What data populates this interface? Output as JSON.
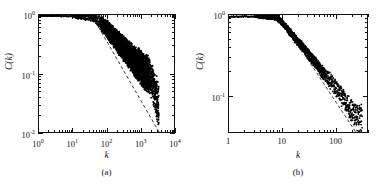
{
  "figure": {
    "panels": [
      {
        "caption": "(a)",
        "xlabel": "k",
        "ylabel": "C(k)",
        "xticklabels": [
          "10",
          "10",
          "10",
          "10",
          "10"
        ],
        "xtickexponents": [
          "0",
          "1",
          "2",
          "3",
          "4"
        ],
        "yticklabels": [
          "10",
          "10",
          "10"
        ],
        "ytickexponents": [
          "0",
          "-1",
          "-2"
        ]
      },
      {
        "caption": "(b)",
        "xlabel": "k",
        "ylabel": "C(k)",
        "xticklabels": [
          "1",
          "10",
          "100"
        ],
        "xtickexponents": [
          "",
          "",
          ""
        ],
        "yticklabels": [
          "10",
          "10"
        ],
        "ytickexponents": [
          "0",
          "-1"
        ]
      }
    ]
  },
  "chart_data": [
    {
      "type": "scatter",
      "title": "",
      "subtitle": "(a)",
      "xlabel": "k",
      "ylabel": "C(k)",
      "xscale": "log",
      "yscale": "log",
      "xlim": [
        1,
        10000
      ],
      "ylim": [
        0.01,
        1
      ],
      "grid": false,
      "legend": null,
      "series": [
        {
          "name": "clustering coefficient data",
          "marker": "filled-circle",
          "color": "#000000",
          "description": "Flat plateau near C(k)=1 for k below ~40, then a power-law decay with a broad dense cloud of points between k=300 and k=3000 spanning C(k) from about 0.3 down to 0.025",
          "points": [
            {
              "x": 1,
              "y": 0.97
            },
            {
              "x": 2,
              "y": 0.96
            },
            {
              "x": 3,
              "y": 0.97
            },
            {
              "x": 4,
              "y": 0.95
            },
            {
              "x": 6,
              "y": 0.96
            },
            {
              "x": 8,
              "y": 0.95
            },
            {
              "x": 10,
              "y": 0.95
            },
            {
              "x": 14,
              "y": 0.94
            },
            {
              "x": 20,
              "y": 0.93
            },
            {
              "x": 30,
              "y": 0.92
            },
            {
              "x": 40,
              "y": 0.9
            },
            {
              "x": 55,
              "y": 0.82
            },
            {
              "x": 70,
              "y": 0.72
            },
            {
              "x": 90,
              "y": 0.62
            },
            {
              "x": 110,
              "y": 0.55
            },
            {
              "x": 140,
              "y": 0.47
            },
            {
              "x": 180,
              "y": 0.4
            },
            {
              "x": 230,
              "y": 0.33
            },
            {
              "x": 300,
              "y": 0.28
            },
            {
              "x": 400,
              "y": 0.23
            },
            {
              "x": 500,
              "y": 0.2
            },
            {
              "x": 650,
              "y": 0.17
            },
            {
              "x": 800,
              "y": 0.15
            },
            {
              "x": 1000,
              "y": 0.13
            },
            {
              "x": 1300,
              "y": 0.11
            },
            {
              "x": 1600,
              "y": 0.1
            },
            {
              "x": 2000,
              "y": 0.085
            },
            {
              "x": 2500,
              "y": 0.06
            },
            {
              "x": 3000,
              "y": 0.04
            },
            {
              "x": 3500,
              "y": 0.028
            }
          ]
        },
        {
          "name": "dashed reference line",
          "marker": "dashed-line",
          "color": "#000000",
          "slope": -1,
          "description": "Dashed guide line of slope -1 passing below the data, from about (40, 0.9) to (4000, 0.009)",
          "points": [
            {
              "x": 40,
              "y": 0.9
            },
            {
              "x": 4000,
              "y": 0.009
            }
          ]
        }
      ]
    },
    {
      "type": "scatter",
      "title": "",
      "subtitle": "(b)",
      "xlabel": "k",
      "ylabel": "C(k)",
      "xscale": "log",
      "yscale": "log",
      "xlim": [
        1,
        400
      ],
      "ylim": [
        0.035,
        1
      ],
      "grid": false,
      "legend": null,
      "series": [
        {
          "name": "clustering coefficient data",
          "marker": "filled-circle",
          "color": "#000000",
          "description": "Plateau near C(k)=1 up to k about 8, then a narrow power-law decaying band that broadens into scattered points beyond k=120",
          "points": [
            {
              "x": 1,
              "y": 0.95
            },
            {
              "x": 2,
              "y": 0.96
            },
            {
              "x": 3,
              "y": 0.95
            },
            {
              "x": 4,
              "y": 0.96
            },
            {
              "x": 5,
              "y": 0.95
            },
            {
              "x": 6,
              "y": 0.94
            },
            {
              "x": 7,
              "y": 0.94
            },
            {
              "x": 8,
              "y": 0.92
            },
            {
              "x": 10,
              "y": 0.82
            },
            {
              "x": 12,
              "y": 0.7
            },
            {
              "x": 15,
              "y": 0.58
            },
            {
              "x": 18,
              "y": 0.5
            },
            {
              "x": 22,
              "y": 0.43
            },
            {
              "x": 27,
              "y": 0.37
            },
            {
              "x": 33,
              "y": 0.31
            },
            {
              "x": 40,
              "y": 0.27
            },
            {
              "x": 50,
              "y": 0.22
            },
            {
              "x": 60,
              "y": 0.19
            },
            {
              "x": 75,
              "y": 0.16
            },
            {
              "x": 90,
              "y": 0.14
            },
            {
              "x": 110,
              "y": 0.12
            },
            {
              "x": 130,
              "y": 0.1
            },
            {
              "x": 160,
              "y": 0.085
            },
            {
              "x": 190,
              "y": 0.07
            },
            {
              "x": 230,
              "y": 0.06
            },
            {
              "x": 270,
              "y": 0.055
            },
            {
              "x": 320,
              "y": 0.05
            }
          ]
        },
        {
          "name": "dashed reference line",
          "marker": "dashed-line",
          "color": "#000000",
          "slope": -1,
          "description": "Dashed guide line of slope -1 lying below the data band, from about (9, 0.95) to (260, 0.033)",
          "points": [
            {
              "x": 9,
              "y": 0.95
            },
            {
              "x": 260,
              "y": 0.033
            }
          ]
        }
      ]
    }
  ]
}
